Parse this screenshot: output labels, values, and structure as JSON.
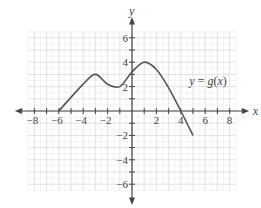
{
  "chart_data": {
    "type": "line",
    "title": "",
    "xlabel": "x",
    "ylabel": "y",
    "xlim": [
      -8.5,
      8.5
    ],
    "ylim": [
      -6.5,
      6.5
    ],
    "grid": true,
    "x_ticks": [
      -8,
      -6,
      -4,
      -2,
      2,
      4,
      6,
      8
    ],
    "y_ticks": [
      -6,
      -4,
      -2,
      2,
      4,
      6
    ],
    "series": [
      {
        "name": "y = g(x)",
        "color": "#555555",
        "x": [
          -6,
          -4,
          -3,
          -2,
          -1,
          0,
          1,
          2,
          3,
          4,
          5
        ],
        "y": [
          0,
          2.2,
          3,
          2.2,
          2,
          3.2,
          4,
          3.4,
          1.9,
          0,
          -2
        ]
      }
    ],
    "annotations": [
      {
        "text": "y = g(x)",
        "x": 4.7,
        "y": 2.5
      }
    ]
  }
}
